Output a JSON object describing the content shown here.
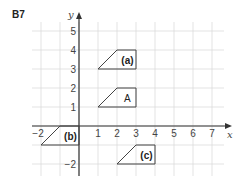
{
  "question_label": "B7",
  "axes": {
    "x_label": "x",
    "y_label": "y",
    "x_ticks": [
      "−2",
      "1",
      "2",
      "3",
      "4",
      "5",
      "6",
      "7"
    ],
    "y_ticks": [
      "5",
      "4",
      "3",
      "2",
      "1",
      "−2"
    ]
  },
  "shapes": [
    {
      "name": "A",
      "label": "A",
      "points": [
        [
          1,
          1
        ],
        [
          2,
          2
        ],
        [
          3,
          2
        ],
        [
          3,
          1
        ]
      ]
    },
    {
      "name": "a",
      "label": "(a)",
      "points": [
        [
          1,
          3
        ],
        [
          2,
          4
        ],
        [
          3,
          4
        ],
        [
          3,
          3
        ]
      ]
    },
    {
      "name": "b",
      "label": "(b)",
      "points": [
        [
          -2,
          -1
        ],
        [
          -1,
          0
        ],
        [
          0,
          0
        ],
        [
          0,
          -1
        ]
      ]
    },
    {
      "name": "c",
      "label": "(c)",
      "points": [
        [
          2,
          -2
        ],
        [
          3,
          -1
        ],
        [
          4,
          -1
        ],
        [
          4,
          -2
        ]
      ]
    }
  ],
  "colors": {
    "grid": "#dcdcdc",
    "axis": "#333333",
    "shape": "#444444"
  }
}
